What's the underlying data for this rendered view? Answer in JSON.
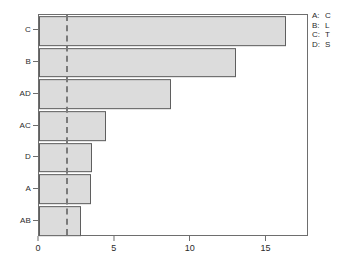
{
  "chart_data": {
    "type": "bar",
    "orientation": "horizontal",
    "title": "",
    "xlabel": "",
    "ylabel": "",
    "categories": [
      "C",
      "B",
      "AD",
      "AC",
      "D",
      "A",
      "AB"
    ],
    "values": [
      16.3,
      13.0,
      8.7,
      4.4,
      3.5,
      3.4,
      2.8
    ],
    "xlim": [
      0,
      17.8
    ],
    "ylim": [
      0,
      7
    ],
    "xticks": [
      0,
      5,
      10,
      15
    ],
    "xtick_labels": [
      "0",
      "5",
      "10",
      "15"
    ],
    "ytick_labels": [
      "C",
      "B",
      "AD",
      "AC",
      "D",
      "A",
      "AB"
    ],
    "grid": false,
    "legend_position": "outside-top-right",
    "reference_line": {
      "value": 1.8,
      "style": "dashed",
      "color": "#7a7a7a"
    },
    "bar_fill_color": "#dcdcdc",
    "bar_edge_color": "#5f5f5f",
    "frame_color": "#6e6e6e",
    "series": [
      {
        "name": "Standardized Effect",
        "values": [
          16.3,
          13.0,
          8.7,
          4.4,
          3.5,
          3.4,
          2.8
        ]
      }
    ],
    "annotations": []
  },
  "legend": {
    "entries": [
      {
        "key": "A:",
        "value": "C"
      },
      {
        "key": "B:",
        "value": "L"
      },
      {
        "key": "C:",
        "value": "T"
      },
      {
        "key": "D:",
        "value": "S"
      }
    ]
  }
}
